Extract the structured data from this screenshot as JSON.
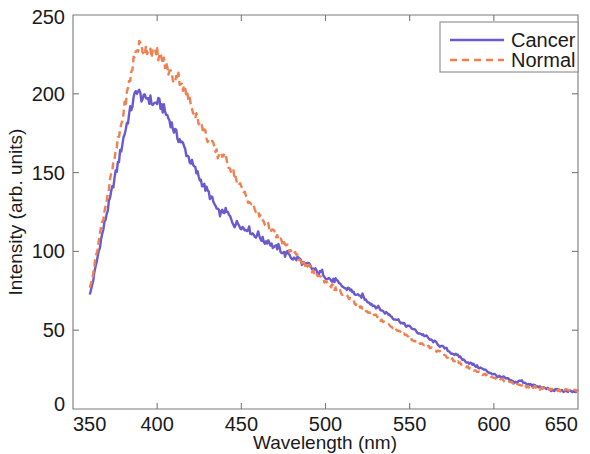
{
  "chart_data": {
    "type": "line",
    "title": "",
    "xlabel": "Wavelength (nm)",
    "ylabel": "Intensity (arb. units)",
    "xlim": [
      350,
      650
    ],
    "ylim": [
      0,
      250
    ],
    "xticks": [
      350,
      400,
      450,
      500,
      550,
      600,
      650
    ],
    "yticks": [
      0,
      50,
      100,
      150,
      200,
      250
    ],
    "grid": false,
    "legend_position": "top-right",
    "legend_entries": [
      "Cancer",
      "Normal"
    ],
    "x": [
      360,
      362,
      364,
      366,
      368,
      370,
      372,
      374,
      376,
      378,
      380,
      382,
      384,
      386,
      388,
      390,
      392,
      394,
      396,
      398,
      400,
      402,
      404,
      406,
      408,
      410,
      412,
      414,
      416,
      418,
      420,
      422,
      424,
      426,
      428,
      430,
      432,
      434,
      436,
      438,
      440,
      442,
      444,
      446,
      448,
      450,
      452,
      454,
      456,
      458,
      460,
      462,
      464,
      466,
      468,
      470,
      472,
      474,
      476,
      478,
      480,
      482,
      484,
      486,
      488,
      490,
      492,
      494,
      496,
      498,
      500,
      502,
      504,
      506,
      508,
      510,
      512,
      514,
      516,
      518,
      520,
      522,
      524,
      526,
      528,
      530,
      532,
      534,
      536,
      538,
      540,
      542,
      544,
      546,
      548,
      550,
      552,
      554,
      556,
      558,
      560,
      562,
      564,
      566,
      568,
      570,
      572,
      574,
      576,
      578,
      580,
      582,
      584,
      586,
      588,
      590,
      592,
      594,
      596,
      598,
      600,
      602,
      604,
      606,
      608,
      610,
      612,
      614,
      616,
      618,
      620,
      622,
      624,
      626,
      628,
      630,
      632,
      634,
      636,
      638,
      640,
      642,
      644,
      646,
      648,
      650
    ],
    "series": [
      {
        "name": "Cancer",
        "color": "#6A5ACD",
        "style": "solid",
        "values": [
          72,
          82,
          93,
          104,
          114,
          124,
          133,
          143,
          152,
          162,
          172,
          181,
          189,
          196,
          203,
          199,
          196,
          198,
          196,
          193,
          195,
          193,
          190,
          186,
          182,
          177,
          173,
          170,
          166,
          161,
          157,
          153,
          149,
          145,
          141,
          138,
          134,
          130,
          125,
          124,
          126,
          124,
          120,
          117,
          118,
          116,
          114,
          115,
          112,
          110,
          111,
          108,
          106,
          107,
          104,
          102,
          103,
          100,
          98,
          99,
          96,
          95,
          96,
          93,
          91,
          92,
          89,
          88,
          86,
          87,
          84,
          83,
          81,
          82,
          79,
          78,
          76,
          77,
          74,
          73,
          71,
          72,
          69,
          68,
          66,
          65,
          64,
          62,
          61,
          60,
          58,
          57,
          56,
          54,
          53,
          52,
          51,
          49,
          48,
          47,
          46,
          44,
          43,
          42,
          40,
          39,
          38,
          36,
          35,
          34,
          33,
          31,
          30,
          29,
          28,
          27,
          26,
          25,
          24,
          23,
          22,
          21,
          20,
          20,
          19,
          18,
          17,
          17,
          18,
          17,
          16,
          15,
          15,
          14,
          14,
          13,
          13,
          12,
          12,
          12,
          12,
          11,
          11,
          11,
          11,
          11
        ],
        "peak": {
          "x": 388,
          "y": 205
        }
      },
      {
        "name": "Normal",
        "color": "#F08050",
        "style": "dashed",
        "values": [
          76,
          87,
          99,
          111,
          122,
          133,
          144,
          155,
          166,
          177,
          188,
          199,
          210,
          221,
          229,
          231,
          227,
          229,
          228,
          225,
          226,
          223,
          220,
          216,
          213,
          209,
          212,
          208,
          203,
          198,
          193,
          189,
          185,
          180,
          176,
          172,
          169,
          165,
          161,
          163,
          160,
          156,
          152,
          148,
          144,
          140,
          137,
          133,
          130,
          127,
          124,
          121,
          118,
          116,
          113,
          111,
          108,
          106,
          104,
          102,
          99,
          98,
          96,
          94,
          92,
          90,
          88,
          86,
          85,
          83,
          81,
          79,
          78,
          76,
          75,
          73,
          72,
          70,
          69,
          67,
          66,
          64,
          63,
          61,
          60,
          59,
          57,
          56,
          55,
          53,
          52,
          51,
          49,
          48,
          47,
          45,
          44,
          43,
          42,
          41,
          40,
          39,
          38,
          37,
          36,
          35,
          33,
          32,
          31,
          30,
          29,
          28,
          27,
          26,
          25,
          24,
          23,
          22,
          22,
          21,
          20,
          19,
          19,
          18,
          17,
          17,
          16,
          16,
          15,
          15,
          14,
          14,
          14,
          13,
          13,
          13,
          12,
          12,
          12,
          12,
          12,
          12,
          12,
          12,
          12,
          12
        ],
        "peak": {
          "x": 385,
          "y": 231
        }
      }
    ]
  },
  "axes": {
    "x_label": "Wavelength (nm)",
    "y_label": "Intensity (arb. units)",
    "x_ticks": [
      "350",
      "400",
      "450",
      "500",
      "550",
      "600",
      "650"
    ],
    "y_ticks": [
      "0",
      "50",
      "100",
      "150",
      "200",
      "250"
    ]
  },
  "legend": {
    "items": [
      {
        "label": "Cancer",
        "color": "#6A5ACD",
        "style": "solid"
      },
      {
        "label": "Normal",
        "color": "#F08050",
        "style": "dashed"
      }
    ]
  }
}
